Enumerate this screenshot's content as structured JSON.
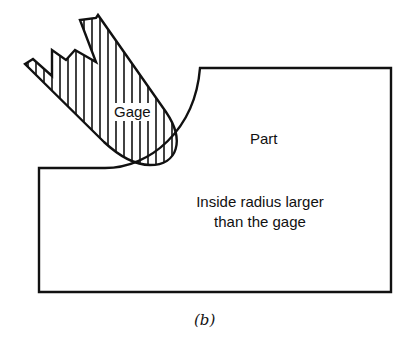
{
  "figure": {
    "caption": "(b)",
    "gage": {
      "label": "Gage",
      "fill": "hatched-vertical"
    },
    "part": {
      "label": "Part",
      "note_line1": "Inside radius larger",
      "note_line2": "than the gage"
    },
    "colors": {
      "stroke": "#111111",
      "background": "#ffffff"
    }
  }
}
